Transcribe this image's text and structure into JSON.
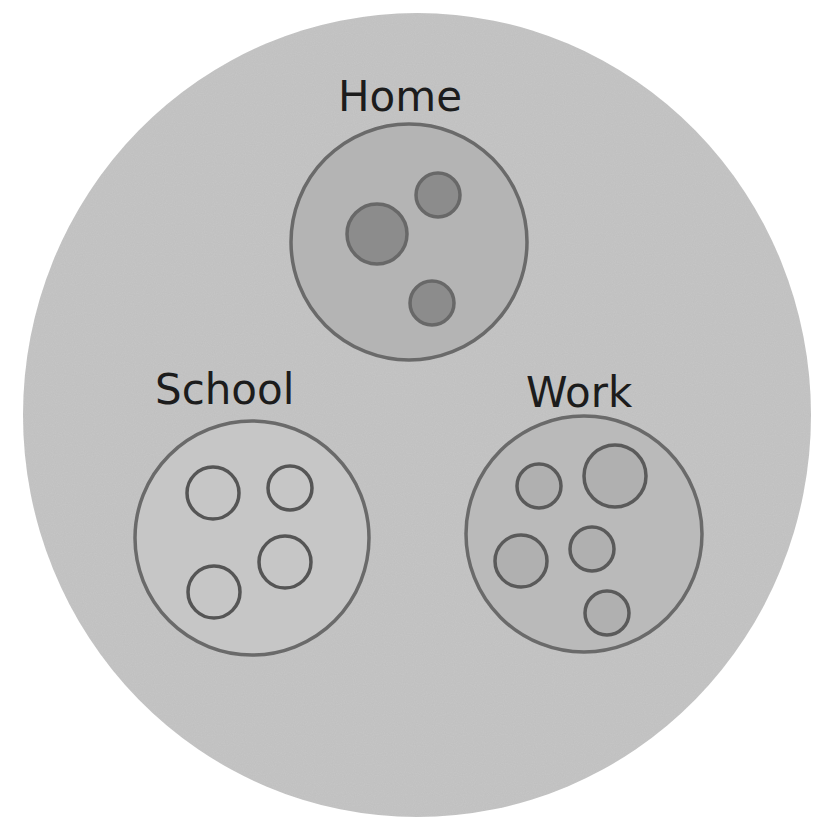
{
  "diagram": {
    "type": "nested-circle-diagram",
    "title_fragment": "",
    "colors": {
      "page_background": "#ffffff",
      "outer_fill": "#c6c6c6",
      "group_stroke": "#6a6a6a",
      "home_fill": "#b4b4b4",
      "school_fill": "#c6c6c6",
      "work_fill": "#bababa",
      "home_dot_fill": "#8c8c8c",
      "home_dot_stroke": "#686868",
      "school_dot_fill": "none",
      "school_dot_stroke": "#555555",
      "work_dot_fill": "#b0b0b0",
      "work_dot_stroke": "#5a5a5a",
      "label_text": "#1c1c1c"
    },
    "outer": {
      "cx": 417,
      "cy": 415,
      "rx": 394,
      "ry": 402
    },
    "groups": [
      {
        "label": "Home",
        "label_x": 338,
        "label_y": 76,
        "circle": {
          "cx": 409,
          "cy": 242,
          "r": 118
        },
        "members": [
          {
            "cx": 377,
            "cy": 234,
            "r": 30
          },
          {
            "cx": 438,
            "cy": 195,
            "r": 22
          },
          {
            "cx": 432,
            "cy": 303,
            "r": 22
          }
        ]
      },
      {
        "label": "School",
        "label_x": 155,
        "label_y": 369,
        "circle": {
          "cx": 252,
          "cy": 538,
          "r": 117
        },
        "members": [
          {
            "cx": 213,
            "cy": 493,
            "r": 26
          },
          {
            "cx": 290,
            "cy": 488,
            "r": 22
          },
          {
            "cx": 285,
            "cy": 562,
            "r": 26
          },
          {
            "cx": 214,
            "cy": 592,
            "r": 26
          }
        ]
      },
      {
        "label": "Work",
        "label_x": 526,
        "label_y": 372,
        "circle": {
          "cx": 584,
          "cy": 534,
          "r": 118
        },
        "members": [
          {
            "cx": 539,
            "cy": 486,
            "r": 22
          },
          {
            "cx": 615,
            "cy": 476,
            "r": 31
          },
          {
            "cx": 521,
            "cy": 561,
            "r": 26
          },
          {
            "cx": 592,
            "cy": 549,
            "r": 22
          },
          {
            "cx": 607,
            "cy": 613,
            "r": 22
          }
        ]
      }
    ]
  }
}
